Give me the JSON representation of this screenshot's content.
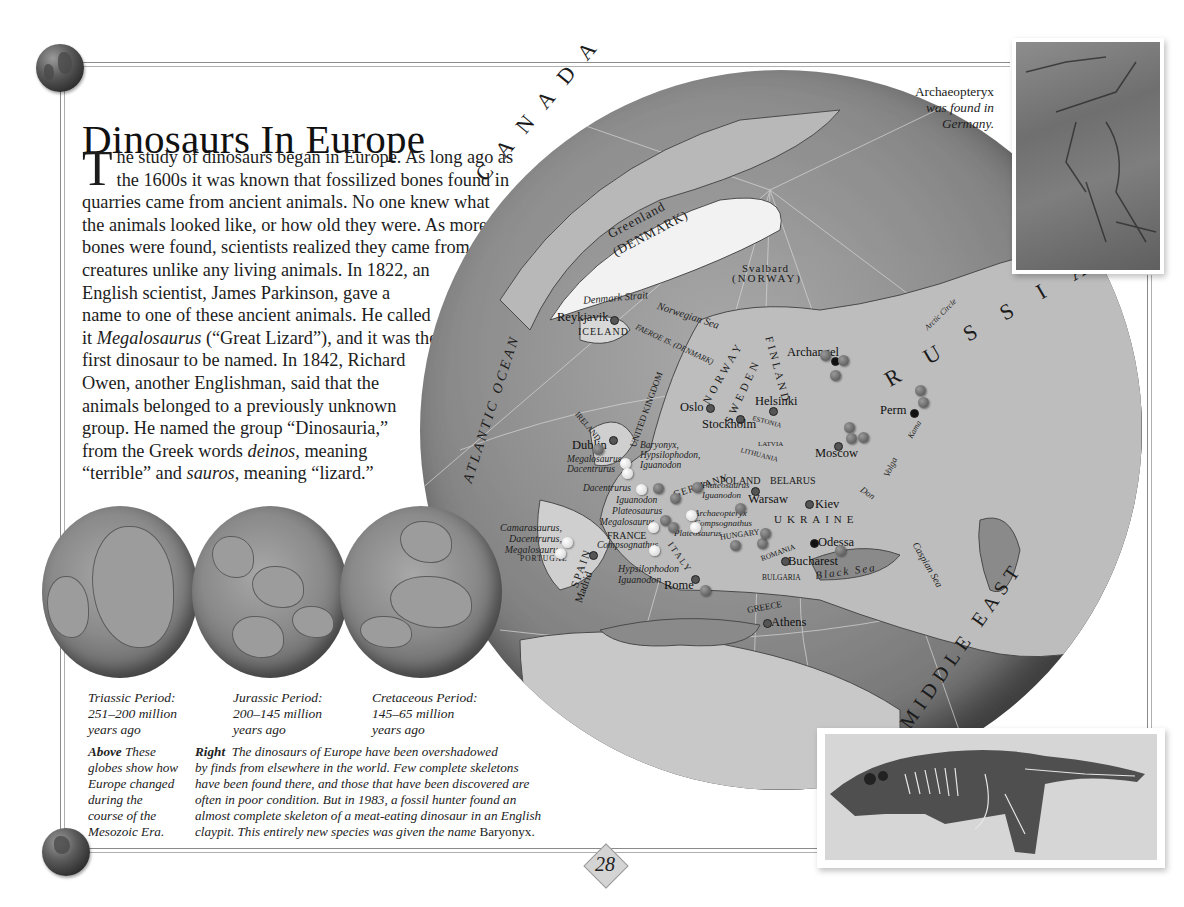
{
  "page": {
    "title": "Dinosaurs In Europe",
    "page_number": "28"
  },
  "intro": {
    "dropcap": "T",
    "lines": [
      "he study of dinosaurs began in Europe. As long ago as",
      "the 1600s it was known that fossilized bones found in",
      "quarries came from ancient animals. No one knew what",
      "the animals looked like, or how old they were. As more",
      "bones were found, scientists realized they came from",
      "creatures unlike any living animals. In 1822, an",
      "English scientist, James Parkinson, gave a",
      "name to one of these ancient animals. He called"
    ],
    "line9_pre": "it ",
    "line9_ital": "Megalosaurus",
    "line9_post": " (“Great Lizard”), and it was the",
    "lines_b": [
      "first dinosaur to be named. In 1842, Richard",
      "Owen, another Englishman, said that the",
      "animals belonged to a previously unknown",
      "group. He named the group “Dinosauria,”"
    ],
    "line14_pre": "from the Greek words ",
    "line14_ital": "deinos,",
    "line14_post": " meaning",
    "line15_pre": "“terrible” and ",
    "line15_ital": "sauros,",
    "line15_post": " meaning “lizard.”"
  },
  "periods": [
    {
      "name": "Triassic Period:",
      "range": "251–200 million",
      "suffix": "years ago"
    },
    {
      "name": "Jurassic Period:",
      "range": "200–145 million",
      "suffix": "years ago"
    },
    {
      "name": "Cretaceous Period:",
      "range": "145–65 million",
      "suffix": "years ago"
    }
  ],
  "caption_above": {
    "lead": "Above",
    "lines": [
      "These",
      "globes show how",
      "Europe changed",
      "during the",
      "course of the",
      "Mesozoic Era."
    ]
  },
  "caption_right": {
    "lead": "Right",
    "lines": [
      "The dinosaurs of Europe have been overshadowed",
      "by finds from elsewhere in the world. Few complete skeletons",
      "have been found there, and those that have been discovered are",
      "often in poor condition. But in 1983, a fossil hunter found an",
      "almost complete skeleton of a meat-eating dinosaur in an English"
    ],
    "last_line": "claypit. This entirely new species was given the name",
    "species": "Baryonyx."
  },
  "archaeopteryx_caption": {
    "name": "Archaeopteryx",
    "line2": "was found in",
    "line3": "Germany."
  },
  "map": {
    "regions": {
      "canada": "CANADA",
      "russia": "RUSSIA",
      "middle_east": "MIDDLE EAST",
      "atlantic": "ATLANTIC OCEAN",
      "greenland": "Greenland",
      "greenland_country": "(DENMARK)",
      "svalbard": "Svalbard",
      "svalbard_country": "(NORWAY)",
      "iceland": "ICELAND",
      "faeroe": "FAEROE IS. (DENMARK)",
      "norway": "NORWAY",
      "sweden": "SWEDEN",
      "finland": "FINLAND",
      "ireland": "IRELAND",
      "uk": "UNITED KINGDOM",
      "germany": "GERMANY",
      "poland": "POLAND",
      "belarus": "BELARUS",
      "ukraine": "UKRAINE",
      "france": "FRANCE",
      "spain": "SPAIN",
      "portugal": "PORTUGAL",
      "italy": "ITALY",
      "hungary": "HUNGARY",
      "romania": "ROMANIA",
      "bulgaria": "BULGARIA",
      "greece": "GREECE",
      "estonia": "ESTONIA",
      "latvia": "LATVIA",
      "lithuania": "LITHUANIA"
    },
    "waters": {
      "denmark_strait": "Denmark Strait",
      "norwegian_sea": "Norwegian Sea",
      "black_sea": "Black Sea",
      "caspian_sea": "Caspian Sea",
      "arctic_circle": "Arctic Circle",
      "volga": "Volga",
      "don": "Don",
      "kama": "Kama"
    },
    "cities": [
      {
        "id": "reykjavik",
        "name": "Reykjavik"
      },
      {
        "id": "oslo",
        "name": "Oslo"
      },
      {
        "id": "stockholm",
        "name": "Stockholm"
      },
      {
        "id": "helsinki",
        "name": "Helsinki"
      },
      {
        "id": "archangel",
        "name": "Archangel"
      },
      {
        "id": "perm",
        "name": "Perm"
      },
      {
        "id": "moscow",
        "name": "Moscow"
      },
      {
        "id": "dublin",
        "name": "Dublin"
      },
      {
        "id": "warsaw",
        "name": "Warsaw"
      },
      {
        "id": "kiev",
        "name": "Kiev"
      },
      {
        "id": "odessa",
        "name": "Odessa"
      },
      {
        "id": "bucharest",
        "name": "Bucharest"
      },
      {
        "id": "madrid",
        "name": "Madrid"
      },
      {
        "id": "rome",
        "name": "Rome"
      },
      {
        "id": "athens",
        "name": "Athens"
      }
    ],
    "dinosaurs": {
      "uk": [
        "Baryonyx,",
        "Hypsilophodon,",
        "Iguanodon"
      ],
      "uk_west": [
        "Megalosaurus,",
        "Dacentrurus"
      ],
      "france_west": "Dacentrurus",
      "france_list": [
        "Iguanodon",
        "Plateosaurus",
        "Megalosaurus"
      ],
      "france_south": "Compsognathus",
      "germany": [
        "Plateosaurus",
        "Iguanodon"
      ],
      "germany_south": [
        "Archaeopteryx",
        "Compsognathus",
        "Plateosaurus"
      ],
      "poland": "Plateosaurus",
      "portugal": [
        "Camarasaurus,",
        "Dacentrurus,",
        "Megalosaurus"
      ],
      "spain": [
        "Hypsilophodon",
        "Iguanodon"
      ]
    }
  }
}
